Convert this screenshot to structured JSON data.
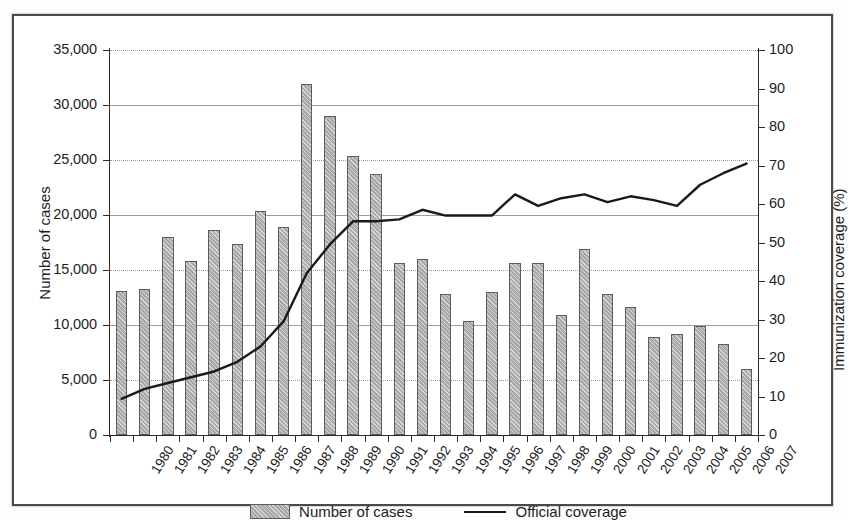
{
  "figure": {
    "background": "#ffffff",
    "frame_color": "#4a4a4a",
    "bar_fill": "#a8a8a8",
    "bar_edge": "#5d5d5d",
    "line_color": "#1a1a1a"
  },
  "legend": {
    "position": "bottom-center",
    "items": [
      {
        "label": "Number of cases",
        "marker": "hatched-bar-swatch"
      },
      {
        "label": "Official coverage",
        "marker": "line-swatch"
      }
    ]
  },
  "axes": {
    "left": {
      "title": "Number of cases",
      "ticks": [
        "0",
        "5,000",
        "10,000",
        "15,000",
        "20,000",
        "25,000",
        "30,000",
        "35,000"
      ],
      "min": 0,
      "max": 35000,
      "step": 5000
    },
    "right": {
      "title": "Immunization coverage (%)",
      "ticks": [
        "0",
        "10",
        "20",
        "30",
        "40",
        "50",
        "60",
        "70",
        "80",
        "90",
        "100"
      ],
      "min": 0,
      "max": 100,
      "step": 10
    },
    "bottom": {
      "title": ""
    }
  },
  "chart_data": {
    "type": "bar",
    "title": "",
    "subtitle": "",
    "xlabel": "",
    "ylabel": "Number of cases",
    "y2label": "Immunization coverage (%)",
    "ylim": [
      0,
      35000
    ],
    "y2lim": [
      0,
      100
    ],
    "grid": true,
    "legend_position": "bottom",
    "categories": [
      "1980",
      "1981",
      "1982",
      "1983",
      "1984",
      "1985",
      "1986",
      "1987",
      "1988",
      "1989",
      "1990",
      "1991",
      "1992",
      "1993",
      "1994",
      "1995",
      "1996",
      "1997",
      "1998",
      "1999",
      "2000",
      "2001",
      "2002",
      "2003",
      "2004",
      "2005",
      "2006",
      "2007"
    ],
    "series": [
      {
        "name": "Number of cases",
        "type": "bar",
        "axis": "left",
        "unit": "cases",
        "values": [
          13100,
          13300,
          18000,
          15800,
          18600,
          17400,
          20400,
          18900,
          31900,
          29000,
          25400,
          23700,
          15600,
          16000,
          12800,
          10400,
          13000,
          15600,
          15600,
          10900,
          16900,
          12800,
          11600,
          8900,
          9200,
          9900,
          8300,
          6000
        ]
      },
      {
        "name": "Official coverage",
        "type": "line",
        "axis": "right",
        "unit": "%",
        "values": [
          9.4,
          12.0,
          13.5,
          15.0,
          16.5,
          19.0,
          23.0,
          29.5,
          42.0,
          49.5,
          55.5,
          55.5,
          56.0,
          58.5,
          57.0,
          57.0,
          57.0,
          62.5,
          59.5,
          61.5,
          62.5,
          60.5,
          62.0,
          61.0,
          59.5,
          65.0,
          68.0,
          70.5
        ]
      }
    ]
  }
}
